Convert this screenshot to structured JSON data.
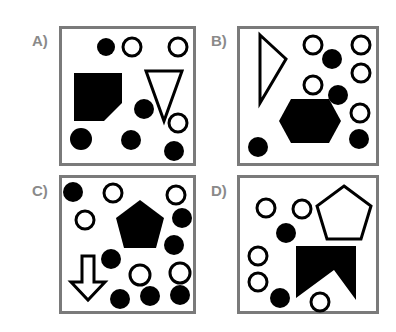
{
  "question": {
    "options": [
      {
        "label": "A)",
        "shapes": [
          "filled-circle",
          "outline-circle",
          "outline-circle",
          "filled-pentagon-irregular",
          "outline-triangle-down",
          "filled-circle",
          "outline-circle",
          "filled-circle",
          "filled-circle",
          "filled-circle"
        ]
      },
      {
        "label": "B)",
        "shapes": [
          "outline-triangle-right",
          "outline-circle",
          "filled-circle",
          "outline-circle",
          "outline-circle",
          "outline-circle",
          "filled-circle",
          "filled-hexagon",
          "outline-circle",
          "filled-circle",
          "filled-circle"
        ]
      },
      {
        "label": "C)",
        "shapes": [
          "filled-circle",
          "outline-circle",
          "outline-circle",
          "outline-circle",
          "filled-pentagon",
          "filled-circle",
          "filled-circle",
          "filled-circle",
          "outline-arrow-down",
          "outline-circle",
          "outline-circle",
          "filled-circle",
          "filled-circle",
          "filled-circle"
        ]
      },
      {
        "label": "D)",
        "shapes": [
          "outline-circle",
          "outline-circle",
          "outline-pentagon",
          "filled-circle",
          "outline-circle",
          "filled-chevron-notch",
          "outline-circle",
          "filled-circle",
          "outline-circle"
        ]
      }
    ]
  },
  "colors": {
    "border": "#7a7a7a",
    "shape": "#000000",
    "label": "#8a8a8a"
  }
}
